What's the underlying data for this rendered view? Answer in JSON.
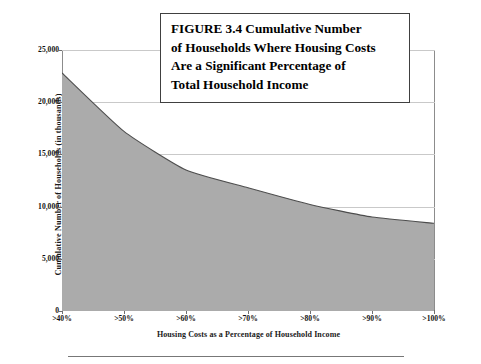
{
  "figure": {
    "title_lines": [
      "FIGURE 3.4  Cumulative Number",
      "of Households Where Housing Costs",
      "Are a Significant Percentage of",
      "Total Household Income"
    ]
  },
  "axes": {
    "y_title": "Cumulative Number of Households (in thousands)",
    "x_title": "Housing Costs as a Percentage of Household Income",
    "y_tick_labels": [
      "25,000",
      "20,000",
      "15,000",
      "10,000",
      "5,000",
      "0"
    ],
    "x_tick_labels": [
      ">40%",
      ">50%",
      ">60%",
      ">70%",
      ">80%",
      ">90%",
      ">100%"
    ]
  },
  "style": {
    "area_fill": "#ababab",
    "area_stroke": "#4d4d4d",
    "gridline_color": "#c9c9c9",
    "axis_color": "#6e6e6e",
    "title_border": "#404040",
    "text_color": "#111111"
  },
  "chart_data": {
    "type": "area",
    "xlabel": "Housing Costs as a Percentage of Household Income",
    "ylabel": "Cumulative Number of Households (in thousands)",
    "categories": [
      ">40%",
      ">50%",
      ">60%",
      ">70%",
      ">80%",
      ">90%",
      ">100%"
    ],
    "values": [
      22800,
      17200,
      13500,
      11800,
      10200,
      9000,
      8400
    ],
    "ylim": [
      0,
      25000
    ],
    "yticks": [
      0,
      5000,
      10000,
      15000,
      20000,
      25000
    ],
    "grid": true,
    "legend": false,
    "series": [
      {
        "name": "Cumulative Number of Households",
        "values": [
          22800,
          17200,
          13500,
          11800,
          10200,
          9000,
          8400
        ]
      }
    ]
  }
}
